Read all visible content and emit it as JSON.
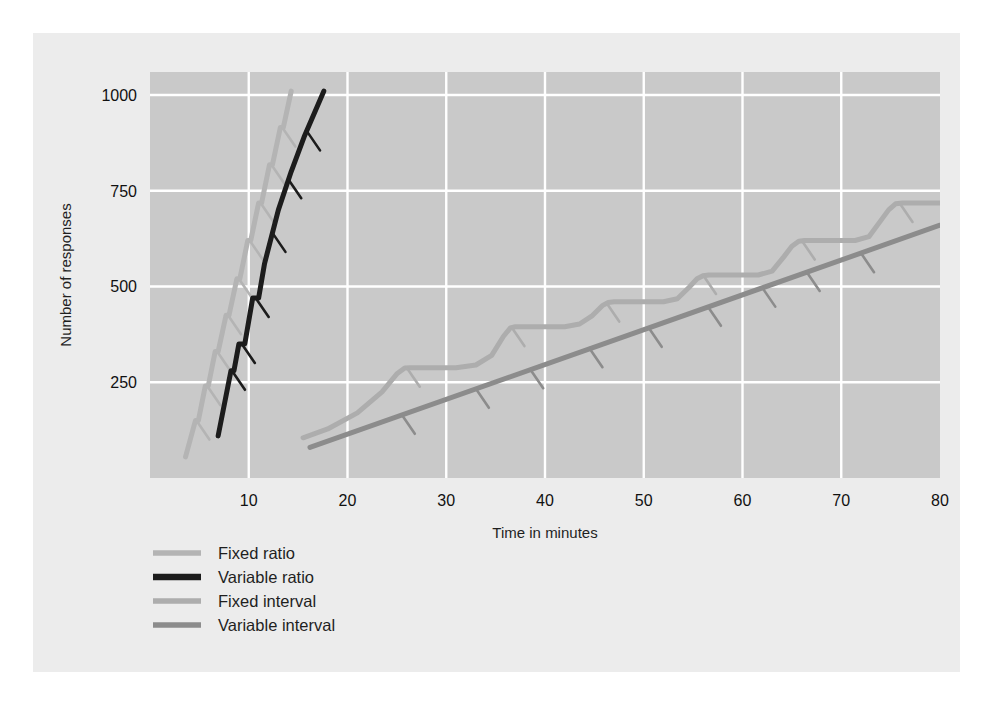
{
  "chart_data": {
    "type": "line",
    "title": "",
    "xlabel": "Time in minutes",
    "ylabel": "Number of responses",
    "xlim": [
      0,
      80
    ],
    "ylim": [
      0,
      1060
    ],
    "xticks": [
      10,
      20,
      30,
      40,
      50,
      60,
      70,
      80
    ],
    "xtick_labels": [
      "10",
      "20",
      "30",
      "40",
      "50",
      "60",
      "70",
      "80"
    ],
    "yticks": [
      250,
      500,
      750,
      1000
    ],
    "ytick_labels": [
      "250",
      "500",
      "750",
      "1000"
    ],
    "grid": true,
    "grid_color": "#ffffff",
    "plot_bg": "#c9c9c9",
    "legend_position": "below-left",
    "series": [
      {
        "name": "Fixed ratio",
        "color": "#b4b4b4",
        "width": 5,
        "style": "stepped-steep",
        "points": [
          [
            3.6,
            55
          ],
          [
            4.6,
            150
          ],
          [
            4.9,
            150
          ],
          [
            5.6,
            240
          ],
          [
            5.9,
            240
          ],
          [
            6.6,
            330
          ],
          [
            6.9,
            330
          ],
          [
            7.7,
            425
          ],
          [
            8.0,
            425
          ],
          [
            8.8,
            520
          ],
          [
            9.1,
            520
          ],
          [
            9.9,
            620
          ],
          [
            10.2,
            620
          ],
          [
            11.0,
            718
          ],
          [
            11.3,
            718
          ],
          [
            12.1,
            818
          ],
          [
            12.4,
            818
          ],
          [
            13.2,
            915
          ],
          [
            13.5,
            915
          ],
          [
            14.3,
            1010
          ]
        ],
        "reinforcement_marks": [
          [
            4.7,
            150
          ],
          [
            5.8,
            240
          ],
          [
            6.8,
            330
          ],
          [
            7.9,
            425
          ],
          [
            9.0,
            520
          ],
          [
            10.1,
            620
          ],
          [
            11.2,
            718
          ],
          [
            12.3,
            818
          ],
          [
            13.4,
            915
          ]
        ]
      },
      {
        "name": "Variable ratio",
        "color": "#1c1c1c",
        "width": 5,
        "style": "steep-irregular",
        "points": [
          [
            6.9,
            110
          ],
          [
            8.2,
            280
          ],
          [
            8.5,
            280
          ],
          [
            9.0,
            350
          ],
          [
            9.6,
            350
          ],
          [
            10.4,
            470
          ],
          [
            11.0,
            470
          ],
          [
            11.6,
            560
          ],
          [
            13.0,
            700
          ],
          [
            14.3,
            800
          ],
          [
            15.6,
            890
          ],
          [
            17.6,
            1010
          ]
        ],
        "reinforcement_marks": [
          [
            8.3,
            280
          ],
          [
            9.3,
            350
          ],
          [
            10.7,
            470
          ],
          [
            12.4,
            640
          ],
          [
            14.0,
            780
          ],
          [
            15.9,
            905
          ]
        ]
      },
      {
        "name": "Fixed interval",
        "color": "#adadad",
        "width": 5,
        "style": "scalloped",
        "points": [
          [
            15.5,
            105
          ],
          [
            18.0,
            128
          ],
          [
            21.0,
            170
          ],
          [
            23.5,
            225
          ],
          [
            25.0,
            272
          ],
          [
            25.8,
            287
          ],
          [
            26.4,
            288
          ],
          [
            31.0,
            288
          ],
          [
            33.0,
            295
          ],
          [
            34.6,
            320
          ],
          [
            35.8,
            370
          ],
          [
            36.5,
            392
          ],
          [
            37.0,
            395
          ],
          [
            42.0,
            395
          ],
          [
            43.5,
            402
          ],
          [
            44.8,
            424
          ],
          [
            45.8,
            450
          ],
          [
            46.4,
            458
          ],
          [
            47.0,
            460
          ],
          [
            52.0,
            460
          ],
          [
            53.4,
            468
          ],
          [
            54.6,
            498
          ],
          [
            55.4,
            520
          ],
          [
            56.0,
            528
          ],
          [
            56.6,
            530
          ],
          [
            61.6,
            530
          ],
          [
            63.0,
            540
          ],
          [
            64.2,
            578
          ],
          [
            65.0,
            605
          ],
          [
            65.7,
            618
          ],
          [
            66.3,
            620
          ],
          [
            71.4,
            620
          ],
          [
            72.8,
            630
          ],
          [
            74.0,
            672
          ],
          [
            74.8,
            700
          ],
          [
            75.5,
            716
          ],
          [
            76.2,
            718
          ],
          [
            80.0,
            718
          ]
        ],
        "reinforcement_marks": [
          [
            26.0,
            288
          ],
          [
            36.6,
            394
          ],
          [
            46.2,
            458
          ],
          [
            56.0,
            530
          ],
          [
            66.0,
            620
          ],
          [
            75.9,
            718
          ]
        ]
      },
      {
        "name": "Variable interval",
        "color": "#8c8c8c",
        "width": 5,
        "style": "straight",
        "points": [
          [
            16.2,
            80
          ],
          [
            80.0,
            660
          ]
        ],
        "reinforcement_marks": [
          [
            25.5,
            165
          ],
          [
            33.0,
            233
          ],
          [
            38.5,
            284
          ],
          [
            44.5,
            339
          ],
          [
            50.5,
            392
          ],
          [
            56.5,
            447
          ],
          [
            62.0,
            497
          ],
          [
            66.5,
            538
          ],
          [
            72.0,
            587
          ]
        ]
      }
    ]
  },
  "legend": {
    "items": [
      {
        "label": "Fixed ratio",
        "color": "#b4b4b4"
      },
      {
        "label": "Variable ratio",
        "color": "#1c1c1c"
      },
      {
        "label": "Fixed interval",
        "color": "#adadad"
      },
      {
        "label": "Variable interval",
        "color": "#8c8c8c"
      }
    ]
  },
  "caption": ""
}
